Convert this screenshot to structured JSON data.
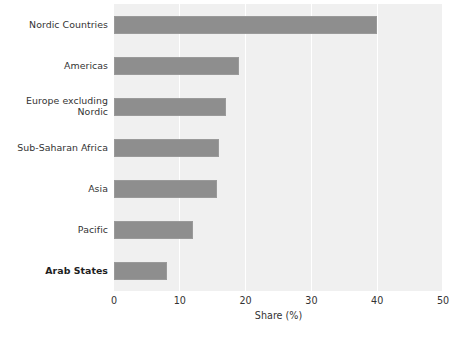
{
  "chart_data": {
    "type": "bar",
    "orientation": "horizontal",
    "title": "",
    "xlabel": "Share (%)",
    "ylabel": "",
    "xlim": [
      0,
      50
    ],
    "xticks": [
      0,
      10,
      20,
      30,
      40,
      50
    ],
    "xtick_labels": [
      "0",
      "10",
      "20",
      "30",
      "40",
      "50"
    ],
    "grid": "vertical",
    "legend": "none",
    "categories": [
      "Nordic Countries",
      "Americas",
      "Europe excluding\nNordic",
      "Sub-Saharan Africa",
      "Asia",
      "Pacific",
      "Arab States"
    ],
    "values": [
      40,
      19,
      17,
      16,
      15.7,
      12,
      8
    ],
    "emphasis": [
      "Arab States"
    ],
    "colors": {
      "bar": "#8e8e8e",
      "bar_edge": "#9a9a9a",
      "plot_background": "#f0f0f0",
      "gridline": "#ffffff",
      "figure_background": "#ffffff",
      "text": "#333333"
    }
  },
  "axis": {
    "x_title": "Share (%)"
  }
}
